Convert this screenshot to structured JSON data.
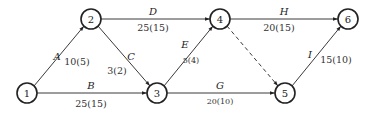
{
  "diagram": {
    "type": "activity-on-arrow network",
    "nodes": [
      {
        "id": "1",
        "label": "1",
        "x": 27,
        "y": 93
      },
      {
        "id": "2",
        "label": "2",
        "x": 91,
        "y": 19
      },
      {
        "id": "3",
        "label": "3",
        "x": 157,
        "y": 93
      },
      {
        "id": "4",
        "label": "4",
        "x": 220,
        "y": 19
      },
      {
        "id": "5",
        "label": "5",
        "x": 285,
        "y": 93
      },
      {
        "id": "6",
        "label": "6",
        "x": 348,
        "y": 19
      }
    ],
    "activities": [
      {
        "name": "A",
        "from": "1",
        "to": "2",
        "value": "10(5)"
      },
      {
        "name": "B",
        "from": "1",
        "to": "3",
        "value": "25(15)"
      },
      {
        "name": "C",
        "from": "2",
        "to": "3",
        "value": "3(2)"
      },
      {
        "name": "D",
        "from": "2",
        "to": "4",
        "value": "25(15)"
      },
      {
        "name": "E",
        "from": "3",
        "to": "4",
        "value": "5(4)"
      },
      {
        "name": "G",
        "from": "3",
        "to": "5",
        "value": "20(10)"
      },
      {
        "name": "H",
        "from": "4",
        "to": "6",
        "value": "20(15)"
      },
      {
        "name": "I",
        "from": "5",
        "to": "6",
        "value": "15(10)"
      },
      {
        "name": "",
        "from": "4",
        "to": "5",
        "value": "",
        "dummy": true
      }
    ]
  }
}
